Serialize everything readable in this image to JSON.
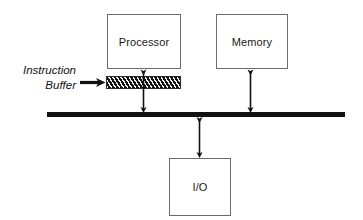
{
  "diagram": {
    "colors": {
      "box_border": "#6b6b6b",
      "bus": "#111111",
      "arrow": "#111111",
      "buffer_fill": "#111111",
      "buffer_hatch": "#f2f2f2",
      "text": "#1a1a1a",
      "background": "#ffffff"
    },
    "nodes": [
      {
        "id": "processor",
        "label": "Processor"
      },
      {
        "id": "memory",
        "label": "Memory"
      },
      {
        "id": "io",
        "label": "I/O"
      }
    ],
    "buffer": {
      "name": "instruction-buffer",
      "caption_line1": "Instruction",
      "caption_line2": "Buffer",
      "fill_style": "diagonal-hatch"
    },
    "bus": {
      "name": "system-bus",
      "label": ""
    },
    "connectors": [
      {
        "id": "processor-bus",
        "from": "processor",
        "to": "system-bus",
        "style": "double-arrow",
        "passes_through": "instruction-buffer"
      },
      {
        "id": "memory-bus",
        "from": "memory",
        "to": "system-bus",
        "style": "double-arrow"
      },
      {
        "id": "bus-io",
        "from": "system-bus",
        "to": "io",
        "style": "double-arrow"
      },
      {
        "id": "caption-to-buffer",
        "from": "instruction-buffer-caption",
        "to": "instruction-buffer",
        "style": "single-arrow-bold"
      }
    ]
  }
}
